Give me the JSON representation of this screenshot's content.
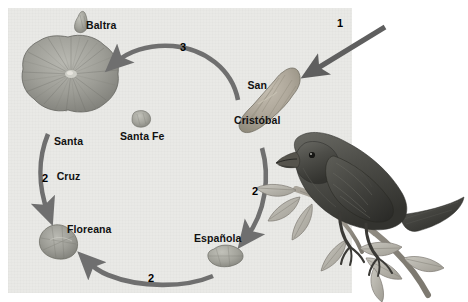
{
  "figure": {
    "kind": "galapagos-finch-dispersal-diagram",
    "panel_background": "#e9e9e6",
    "page_background": "#ffffff",
    "arrow_color": "#6f6f6f",
    "label_color": "#111111"
  },
  "islands": [
    {
      "id": "baltra",
      "label": "Baltra",
      "x": 86,
      "y": 20
    },
    {
      "id": "santa-cruz",
      "label": "Santa\nCruz",
      "x": 54,
      "y": 113
    },
    {
      "id": "santa-fe",
      "label": "Santa Fe",
      "x": 120,
      "y": 131
    },
    {
      "id": "san-cristobal",
      "label": "San\nCristóbal",
      "x": 234,
      "y": 57
    },
    {
      "id": "floreana",
      "label": "Floreana",
      "x": 67,
      "y": 224
    },
    {
      "id": "espanola",
      "label": "Española",
      "x": 194,
      "y": 233
    }
  ],
  "labels": {
    "baltra": "Baltra",
    "santa_cruz_line1": "Santa",
    "santa_cruz_line2": "Cruz",
    "santa_fe": "Santa Fe",
    "san_cristobal_line1": "San",
    "san_cristobal_line2": "Cristóbal",
    "floreana": "Floreana",
    "espanola": "Española"
  },
  "arrows": [
    {
      "id": "arrow-1-colonization",
      "number": "1",
      "from": "outside-mainland",
      "to": "san-cristobal",
      "label_x": 337,
      "label_y": 17
    },
    {
      "id": "arrow-3-top",
      "number": "3",
      "from": "san-cristobal",
      "to": "santa-cruz",
      "label_x": 180,
      "label_y": 41
    },
    {
      "id": "arrow-2-left",
      "number": "2",
      "from": "santa-cruz",
      "to": "floreana",
      "label_x": 42,
      "label_y": 172
    },
    {
      "id": "arrow-2-right",
      "number": "2",
      "from": "san-cristobal",
      "to": "espanola",
      "label_x": 252,
      "label_y": 185
    },
    {
      "id": "arrow-2-bottom",
      "number": "2",
      "from": "espanola",
      "to": "floreana",
      "label_x": 148,
      "label_y": 272
    }
  ],
  "numbers": {
    "one": "1",
    "two": "2",
    "three": "3"
  },
  "bird": {
    "id": "darwin-finch",
    "description": "dark finch perched on a leafy branch"
  }
}
